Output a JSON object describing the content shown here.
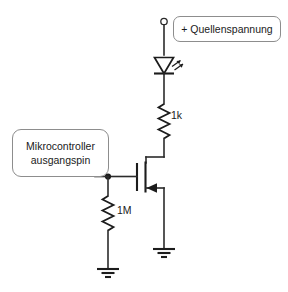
{
  "diagram": {
    "background_color": "#ffffff",
    "line_color": "#1c1c1c",
    "box_border_color": "#8d8d8d"
  },
  "labels": {
    "supply": "+ Quellenspannung",
    "mcu_line1": "Mikrocontroller",
    "mcu_line2": "ausgangspin"
  },
  "components": [
    {
      "id": "supply-terminal",
      "type": "terminal",
      "name": "positive-supply-terminal",
      "label": "+ Quellenspannung"
    },
    {
      "id": "led1",
      "type": "led",
      "name": "led",
      "label": ""
    },
    {
      "id": "r1",
      "type": "resistor",
      "name": "series-resistor",
      "label": "1k"
    },
    {
      "id": "q1",
      "type": "mosfet",
      "name": "n-channel-mosfet",
      "label": ""
    },
    {
      "id": "r2",
      "type": "resistor",
      "name": "pulldown-resistor",
      "label": "1M"
    },
    {
      "id": "gnd1",
      "type": "ground",
      "name": "gate-ground",
      "label": ""
    },
    {
      "id": "gnd2",
      "type": "ground",
      "name": "source-ground",
      "label": ""
    },
    {
      "id": "mcu",
      "type": "label-box",
      "name": "microcontroller-output-pin",
      "label": "Mikrocontroller ausgangspin"
    }
  ],
  "part_labels": {
    "r1": "1k",
    "r2": "1M"
  }
}
